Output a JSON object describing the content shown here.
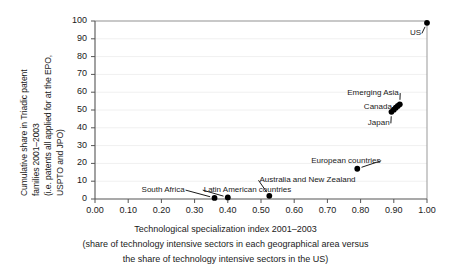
{
  "chart_data": {
    "type": "scatter",
    "title": "",
    "xlabel": "Technological specialization index 2001–2003",
    "xlabel_sub_line1": "(share of technology intensive sectors in each geographical area versus",
    "xlabel_sub_line2": "the share of technology intensive sectors in the US)",
    "ylabel_line1": "Cumulative share in Triadic patent",
    "ylabel_line2": "families 2001–2003",
    "ylabel_line3": "(i.e. patents all applied for at the EPO,",
    "ylabel_line4": "USPTO and JPO)",
    "xlim": [
      0.0,
      1.0
    ],
    "ylim": [
      0,
      100
    ],
    "grid": true,
    "grid_axis": "y",
    "legend": "none",
    "line_style": "dashed",
    "marker": "filled-circle",
    "marker_color": "#000000",
    "line_color": "#000000",
    "xticks": [
      "0.00",
      "0.10",
      "0.20",
      "0.30",
      "0.40",
      "0.50",
      "0.60",
      "0.70",
      "0.80",
      "0.90",
      "1.00"
    ],
    "xtick_values": [
      0.0,
      0.1,
      0.2,
      0.3,
      0.4,
      0.5,
      0.6,
      0.7,
      0.8,
      0.9,
      1.0
    ],
    "yticks": [
      "0",
      "10",
      "20",
      "30",
      "40",
      "50",
      "60",
      "70",
      "80",
      "90",
      "100"
    ],
    "ytick_values": [
      0,
      10,
      20,
      30,
      40,
      50,
      60,
      70,
      80,
      90,
      100
    ],
    "x": [
      0.36,
      0.4,
      0.525,
      0.79,
      0.893,
      0.9,
      0.906,
      0.912,
      0.918,
      1.0
    ],
    "y": [
      0.6,
      0.9,
      1.8,
      17.0,
      49.0,
      50.2,
      51.3,
      52.3,
      53.2,
      99.0
    ],
    "points": [
      {
        "label": "South Africa",
        "x": 0.36,
        "y": 0.6,
        "label_x": 0.205,
        "label_y": 5.0
      },
      {
        "label": "Latin American countries",
        "x": 0.4,
        "y": 0.9,
        "label_x": 0.46,
        "label_y": 5.0
      },
      {
        "label": "Australia and New Zealand",
        "x": 0.525,
        "y": 1.8,
        "label_x": 0.64,
        "label_y": 10.5
      },
      {
        "label": "European countries",
        "x": 0.79,
        "y": 17.0,
        "label_x": 0.755,
        "label_y": 21.5
      },
      {
        "label": "Japan",
        "x": 0.893,
        "y": 49.0,
        "label_x": 0.855,
        "label_y": 42.5
      },
      {
        "label": "Canada",
        "x": 0.906,
        "y": 51.3,
        "label_x": 0.852,
        "label_y": 51.5
      },
      {
        "label": "Emerging Asia",
        "x": 0.918,
        "y": 53.2,
        "label_x": 0.838,
        "label_y": 59.5
      },
      {
        "label": "US",
        "x": 1.0,
        "y": 99.0,
        "label_x": 0.965,
        "label_y": 93.0
      }
    ],
    "annotations": [
      "South Africa",
      "Latin American countries",
      "Australia and New Zealand",
      "European countries",
      "Japan",
      "Canada",
      "Emerging Asia",
      "US"
    ]
  },
  "colors": {
    "background": "#ffffff",
    "axis": "#555555",
    "grid": "#f0f0f0",
    "marker": "#000000",
    "text": "#1a1a1a"
  }
}
